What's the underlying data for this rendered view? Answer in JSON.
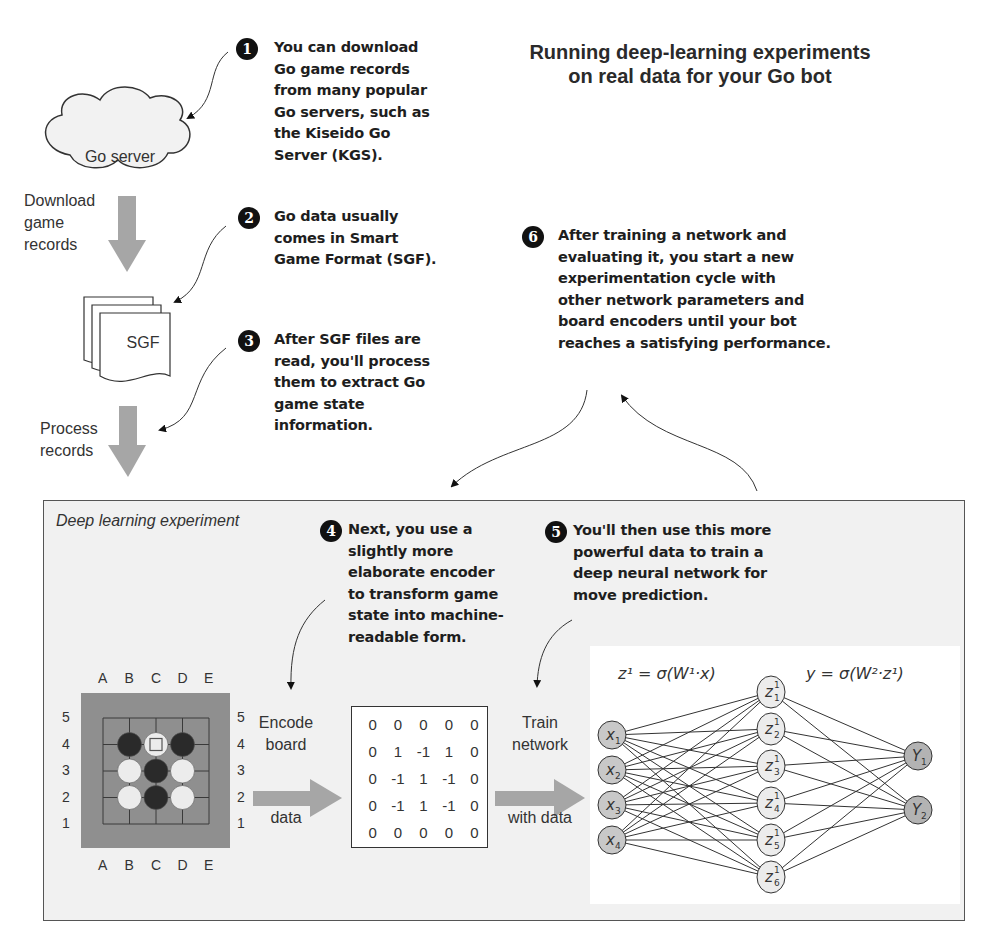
{
  "title": [
    "Running deep-learning experiments",
    "on real data for your Go bot"
  ],
  "pipeline": {
    "go_server_label": "Go server",
    "download_label": [
      "Download",
      "game",
      "records"
    ],
    "sgf_label": "SGF",
    "process_label": [
      "Process",
      "records"
    ]
  },
  "callouts": [
    {
      "number": "1",
      "lines": [
        "You can download",
        "Go game records",
        "from many popular",
        "Go servers, such as",
        "the Kiseido Go",
        "Server (KGS)."
      ]
    },
    {
      "number": "2",
      "lines": [
        "Go data usually",
        "comes in Smart",
        "Game Format (SGF)."
      ]
    },
    {
      "number": "3",
      "lines": [
        "After SGF files are",
        "read, you'll process",
        "them to extract Go",
        "game state",
        "information."
      ]
    },
    {
      "number": "4",
      "lines": [
        "Next, you use a",
        "slightly more",
        "elaborate encoder",
        "to transform game",
        "state into machine-",
        "readable form."
      ]
    },
    {
      "number": "5",
      "lines": [
        "You'll then use this more",
        "powerful data to train a",
        "deep neural network for",
        "move prediction."
      ]
    },
    {
      "number": "6",
      "lines": [
        "After training a network and",
        "evaluating it, you start a new",
        "experimentation cycle with",
        "other network parameters and",
        "board encoders until your bot",
        "reaches a satisfying performance."
      ]
    }
  ],
  "experiment": {
    "panel_title": "Deep learning experiment",
    "board": {
      "columns": [
        "A",
        "B",
        "C",
        "D",
        "E"
      ],
      "rows": [
        "5",
        "4",
        "3",
        "2",
        "1"
      ],
      "stones": [
        {
          "pos": "B4",
          "color": "black"
        },
        {
          "pos": "C4",
          "color": "white",
          "marked": true
        },
        {
          "pos": "D4",
          "color": "black"
        },
        {
          "pos": "B3",
          "color": "white"
        },
        {
          "pos": "C3",
          "color": "black"
        },
        {
          "pos": "D3",
          "color": "white"
        },
        {
          "pos": "B2",
          "color": "white"
        },
        {
          "pos": "C2",
          "color": "black"
        },
        {
          "pos": "D2",
          "color": "white"
        }
      ]
    },
    "encode_label": [
      "Encode",
      "board",
      "data"
    ],
    "matrix": [
      [
        "0",
        "0",
        "0",
        "0",
        "0"
      ],
      [
        "0",
        "1",
        "-1",
        "1",
        "0"
      ],
      [
        "0",
        "-1",
        "1",
        "-1",
        "0"
      ],
      [
        "0",
        "-1",
        "1",
        "-1",
        "0"
      ],
      [
        "0",
        "0",
        "0",
        "0",
        "0"
      ]
    ],
    "train_label": [
      "Train",
      "network",
      "with data"
    ],
    "network": {
      "formula_1": "z¹ = σ(W¹·x)",
      "formula_2": "y = σ(W²·z¹)",
      "inputs": [
        "x1",
        "x2",
        "x3",
        "x4"
      ],
      "hidden": [
        "z1",
        "z2",
        "z3",
        "z4",
        "z5",
        "z6"
      ],
      "outputs": [
        "Y1",
        "Y2"
      ]
    }
  },
  "colors": {
    "arrow_grey": "#a6a6a6",
    "board_bg": "#8f8f8f",
    "panel_bg": "#f1f1f1",
    "node_fill": "#c8c8c8",
    "hidden_fill": "#ececec"
  }
}
